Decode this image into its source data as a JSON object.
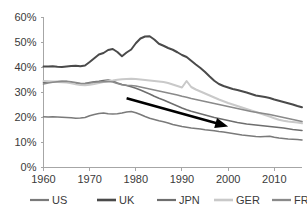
{
  "chart_data": {
    "type": "line",
    "title": "",
    "subtitle": "",
    "xlabel": "",
    "ylabel": "",
    "xlim": [
      1960,
      2016
    ],
    "ylim": [
      0,
      60
    ],
    "y_unit": "%",
    "grid": false,
    "legend_position": "bottom",
    "y_ticks": [
      "0%",
      "10%",
      "20%",
      "30%",
      "40%",
      "50%",
      "60%"
    ],
    "y_tick_values": [
      0,
      10,
      20,
      30,
      40,
      50,
      60
    ],
    "x_ticks": [
      "1960",
      "1970",
      "1980",
      "1990",
      "2000",
      "2010"
    ],
    "x_tick_values": [
      1960,
      1970,
      1980,
      1990,
      2000,
      2010
    ],
    "x": [
      1960,
      1961,
      1962,
      1963,
      1964,
      1965,
      1966,
      1967,
      1968,
      1969,
      1970,
      1971,
      1972,
      1973,
      1974,
      1975,
      1976,
      1977,
      1978,
      1979,
      1980,
      1981,
      1982,
      1983,
      1984,
      1985,
      1986,
      1987,
      1988,
      1989,
      1990,
      1991,
      1992,
      1993,
      1994,
      1995,
      1996,
      1997,
      1998,
      1999,
      2000,
      2001,
      2002,
      2003,
      2004,
      2005,
      2006,
      2007,
      2008,
      2009,
      2010,
      2011,
      2012,
      2013,
      2014,
      2015,
      2016
    ],
    "series": [
      {
        "name": "US",
        "color": "#7a7a7a",
        "width": 1.6,
        "values": [
          20.1,
          20.0,
          20.1,
          20.0,
          19.9,
          19.8,
          19.7,
          19.5,
          19.6,
          19.8,
          20.5,
          21.0,
          21.4,
          21.6,
          21.3,
          21.2,
          21.3,
          21.6,
          22.0,
          22.2,
          21.7,
          21.0,
          20.2,
          19.5,
          19.0,
          18.5,
          18.1,
          17.6,
          17.0,
          16.6,
          16.2,
          15.9,
          15.6,
          15.4,
          15.2,
          14.9,
          14.7,
          14.5,
          14.2,
          14.0,
          13.7,
          13.4,
          13.1,
          12.8,
          12.6,
          12.4,
          12.2,
          12.1,
          12.2,
          12.3,
          11.9,
          11.6,
          11.4,
          11.2,
          11.1,
          11.0,
          10.8
        ]
      },
      {
        "name": "UK",
        "color": "#4a4a4a",
        "width": 2.0,
        "values": [
          40.2,
          40.2,
          40.3,
          40.1,
          40.0,
          40.2,
          40.4,
          40.5,
          40.3,
          40.6,
          42.0,
          43.5,
          45.0,
          45.6,
          46.8,
          47.2,
          46.0,
          44.3,
          45.8,
          47.0,
          49.5,
          51.4,
          52.2,
          52.3,
          51.0,
          49.3,
          48.5,
          47.6,
          46.9,
          45.9,
          44.8,
          44.0,
          42.5,
          41.0,
          39.6,
          38.0,
          36.2,
          34.5,
          33.2,
          32.4,
          31.8,
          31.2,
          30.8,
          30.3,
          29.8,
          29.2,
          28.6,
          28.3,
          28.0,
          27.6,
          27.0,
          26.5,
          26.0,
          25.5,
          25.0,
          24.4,
          23.9
        ]
      },
      {
        "name": "JPN",
        "color": "#6e6e6e",
        "width": 1.6,
        "values": [
          33.8,
          34.0,
          34.1,
          34.2,
          34.3,
          34.2,
          33.8,
          33.4,
          33.2,
          33.4,
          33.8,
          34.1,
          34.3,
          34.6,
          34.8,
          34.4,
          33.6,
          33.0,
          32.6,
          32.1,
          31.5,
          30.8,
          30.0,
          29.2,
          28.3,
          27.5,
          26.8,
          26.0,
          25.2,
          24.4,
          23.6,
          22.9,
          22.3,
          21.8,
          21.3,
          20.8,
          20.3,
          19.8,
          19.4,
          19.0,
          18.6,
          18.2,
          17.8,
          17.5,
          17.2,
          17.0,
          16.8,
          16.6,
          16.4,
          16.2,
          16.0,
          15.8,
          15.6,
          15.3,
          15.0,
          14.8,
          14.6
        ]
      },
      {
        "name": "GER",
        "color": "#c9c9c9",
        "width": 2.0,
        "values": [
          34.4,
          34.3,
          34.2,
          34.0,
          33.9,
          33.8,
          33.5,
          33.1,
          32.8,
          32.7,
          32.9,
          33.2,
          33.6,
          34.0,
          34.4,
          34.6,
          34.9,
          35.1,
          35.2,
          35.3,
          35.2,
          35.0,
          34.8,
          34.6,
          34.4,
          34.2,
          34.0,
          33.6,
          33.0,
          32.4,
          31.8,
          34.4,
          32.0,
          31.0,
          30.2,
          29.4,
          28.6,
          27.8,
          27.0,
          26.3,
          25.6,
          25.0,
          24.4,
          23.8,
          23.2,
          22.6,
          22.0,
          21.4,
          20.8,
          20.2,
          19.5,
          18.9,
          18.5,
          18.2,
          18.0,
          17.8,
          17.5
        ]
      },
      {
        "name": "FRA",
        "color": "#8a8a8a",
        "width": 1.7,
        "values": [
          33.2,
          33.6,
          33.9,
          34.1,
          34.2,
          34.3,
          34.1,
          33.8,
          33.5,
          33.4,
          33.6,
          33.9,
          34.0,
          34.1,
          34.2,
          34.0,
          33.4,
          32.9,
          32.7,
          32.6,
          32.4,
          32.0,
          31.6,
          31.2,
          30.8,
          30.4,
          30.0,
          29.6,
          29.2,
          28.8,
          28.3,
          27.9,
          27.4,
          27.0,
          26.6,
          26.2,
          25.8,
          25.4,
          25.0,
          24.6,
          24.2,
          23.8,
          23.4,
          23.0,
          22.6,
          22.2,
          21.9,
          21.6,
          21.3,
          21.0,
          20.6,
          20.2,
          19.8,
          19.4,
          19.0,
          18.6,
          18.2
        ]
      }
    ],
    "annotations": [
      {
        "name": "trend-arrow",
        "type": "arrow",
        "color": "#000000",
        "x_start": 1978,
        "y_start": 27.5,
        "x_end": 2000,
        "y_end": 16.2
      }
    ]
  },
  "legend": {
    "items": [
      {
        "label": "US"
      },
      {
        "label": "UK"
      },
      {
        "label": "JPN"
      },
      {
        "label": "GER"
      },
      {
        "label": "FRA"
      }
    ]
  }
}
